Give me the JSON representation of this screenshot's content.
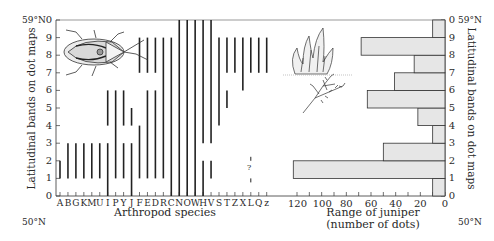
{
  "chart_data": [
    {
      "type": "range-bar",
      "title": "",
      "xlabel": "Arthropod species",
      "ylabel": "Latitudinal bands on dot maps",
      "ylim": [
        0,
        10
      ],
      "y_ticks": [
        "0",
        "1",
        "2",
        "3",
        "4",
        "5",
        "6",
        "7",
        "8",
        "9",
        "0"
      ],
      "lat_top": "59°N",
      "lat_bottom": "50°N",
      "categories": [
        "A",
        "B",
        "G",
        "K",
        "M",
        "U",
        "I",
        "P",
        "Y",
        "J",
        "F",
        "E",
        "D",
        "R",
        "C",
        "N",
        "O",
        "W",
        "H",
        "V",
        "S",
        "T",
        "Z",
        "X",
        "L",
        "Q",
        "z"
      ],
      "series": [
        {
          "species": "A",
          "ranges": [
            [
              1,
              2
            ]
          ]
        },
        {
          "species": "B",
          "ranges": [
            [
              1,
              3
            ]
          ]
        },
        {
          "species": "G",
          "ranges": [
            [
              1,
              3
            ]
          ]
        },
        {
          "species": "K",
          "ranges": [
            [
              1,
              3
            ]
          ]
        },
        {
          "species": "M",
          "ranges": [
            [
              1,
              3
            ]
          ]
        },
        {
          "species": "U",
          "ranges": [
            [
              1,
              3
            ]
          ]
        },
        {
          "species": "I",
          "ranges": [
            [
              0,
              3
            ],
            [
              4,
              6
            ]
          ]
        },
        {
          "species": "P",
          "ranges": [
            [
              1,
              6
            ]
          ]
        },
        {
          "species": "Y",
          "ranges": [
            [
              1,
              3
            ],
            [
              4,
              6
            ]
          ]
        },
        {
          "species": "J",
          "ranges": [
            [
              0,
              3
            ],
            [
              4,
              5
            ]
          ]
        },
        {
          "species": "F",
          "ranges": [
            [
              1,
              4
            ],
            [
              7,
              9
            ]
          ]
        },
        {
          "species": "E",
          "ranges": [
            [
              1,
              6
            ],
            [
              7,
              9
            ]
          ]
        },
        {
          "species": "D",
          "ranges": [
            [
              1,
              6
            ],
            [
              7,
              9
            ]
          ]
        },
        {
          "species": "R",
          "ranges": [
            [
              1,
              9
            ]
          ]
        },
        {
          "species": "C",
          "ranges": [
            [
              0,
              9
            ]
          ]
        },
        {
          "species": "N",
          "ranges": [
            [
              0,
              10
            ]
          ]
        },
        {
          "species": "O",
          "ranges": [
            [
              0,
              10
            ]
          ]
        },
        {
          "species": "W",
          "ranges": [
            [
              0,
              10
            ]
          ]
        },
        {
          "species": "H",
          "ranges": [
            [
              0,
              2
            ],
            [
              3,
              10
            ]
          ]
        },
        {
          "species": "V",
          "ranges": [
            [
              1,
              2
            ],
            [
              3,
              10
            ]
          ]
        },
        {
          "species": "S",
          "ranges": [
            [
              4,
              9
            ]
          ]
        },
        {
          "species": "T",
          "ranges": [
            [
              5,
              6
            ],
            [
              7,
              9
            ]
          ]
        },
        {
          "species": "Z",
          "ranges": [
            [
              7,
              9
            ]
          ]
        },
        {
          "species": "X",
          "ranges": [
            [
              6,
              9
            ]
          ]
        },
        {
          "species": "L",
          "ranges": [
            [
              7,
              9
            ]
          ],
          "uncertain": [
            [
              1,
              2
            ]
          ],
          "annotation": "?"
        },
        {
          "species": "Q",
          "ranges": [
            [
              7,
              9
            ]
          ]
        },
        {
          "species": "z",
          "ranges": [
            [
              7,
              9
            ]
          ]
        }
      ]
    },
    {
      "type": "bar",
      "orientation": "horizontal",
      "xlabel": "Range of juniper (number of dots)",
      "ylabel": "Latitudinal bands on dot maps",
      "xlim": [
        0,
        120
      ],
      "x_ticks": [
        120,
        100,
        80,
        60,
        40,
        20,
        0
      ],
      "x_reversed": true,
      "categories": [
        "0-1",
        "1-2",
        "2-3",
        "3-4",
        "4-5",
        "5-6",
        "6-7",
        "7-8",
        "8-9",
        "9-10"
      ],
      "values": [
        10,
        123,
        50,
        10,
        22,
        63,
        41,
        25,
        68,
        10
      ],
      "bar_color": "#e6e6e6",
      "lat_top": "59°N",
      "lat_bottom": "50°N"
    }
  ],
  "labels": {
    "left_lat_top": "59°N",
    "left_lat_bottom": "50°N",
    "right_lat_top": "59°N",
    "right_lat_bottom": "50°N",
    "left_axis_title": "Latitudinal bands on dot maps",
    "right_axis_title": "Latitudinal bands on dot maps",
    "arthropod_axis_title": "Arthropod species",
    "juniper_axis_title_line1": "Range of juniper",
    "juniper_axis_title_line2": "(number of dots)",
    "question_mark": "?"
  },
  "illustrations": {
    "insect": "shield-bug-drawing",
    "plant": "juniper-drawing"
  }
}
